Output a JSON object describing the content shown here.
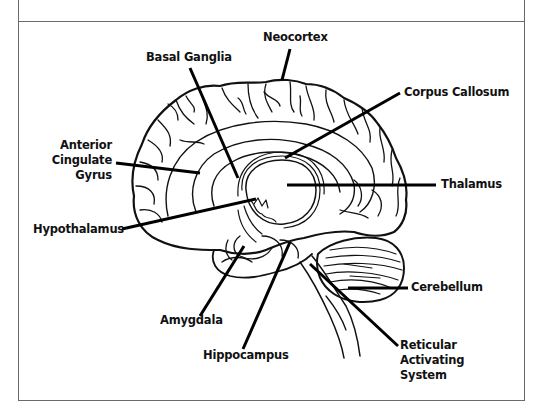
{
  "diagram": {
    "type": "labeled anatomical illustration",
    "line_color": "#111111",
    "frame_color": "#6a6a6a",
    "background": "#ffffff"
  },
  "labels": {
    "neocortex": "Neocortex",
    "basal_ganglia": "Basal Ganglia",
    "corpus_callosum": "Corpus Callosum",
    "anterior_cingulate_gyrus": {
      "line1": "Anterior",
      "line2": "Cingulate",
      "line3": "Gyrus"
    },
    "thalamus": "Thalamus",
    "hypothalamus": "Hypothalamus",
    "cerebellum": "Cerebellum",
    "amygdala": "Amygdala",
    "hippocampus": "Hippocampus",
    "reticular_activating_system": {
      "line1": "Reticular",
      "line2": "Activating",
      "line3": "System"
    }
  }
}
